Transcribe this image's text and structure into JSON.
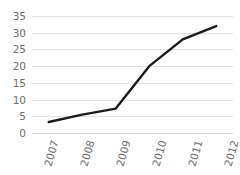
{
  "chart_data": {
    "type": "line",
    "title": "",
    "subtitle": "",
    "xlabel": "",
    "ylabel": "",
    "categories": [
      "2007",
      "2008",
      "2009",
      "2010",
      "2011",
      "2012"
    ],
    "x": [
      2007,
      2008,
      2009,
      2010,
      2011,
      2012
    ],
    "values": [
      3.3,
      5.5,
      7.3,
      20,
      28,
      32
    ],
    "series": [
      {
        "name": "",
        "values": [
          3.3,
          5.5,
          7.3,
          20,
          28,
          32
        ],
        "color": "#1a1a1a"
      }
    ],
    "ylim": [
      0,
      35
    ],
    "yticks": [
      0,
      5,
      10,
      15,
      20,
      25,
      30,
      35
    ],
    "ytick_labels": [
      "0",
      "5",
      "10",
      "15",
      "20",
      "25",
      "30",
      "35"
    ],
    "xtick_labels": [
      "2007",
      "2008",
      "2009",
      "2010",
      "2011",
      "2012"
    ],
    "xtick_rotation": -74,
    "grid": {
      "horizontal": true,
      "vertical": false,
      "color": "#e2e2e2"
    },
    "legend": {
      "visible": false,
      "position": "none",
      "entries": []
    },
    "markers": false,
    "annotations": [],
    "colors": {
      "line": "#1a1a1a",
      "gridline": "#e2e2e2",
      "axis": "#d4d4d4",
      "tick_label": "#6e6e6e",
      "background": "#ffffff"
    }
  }
}
